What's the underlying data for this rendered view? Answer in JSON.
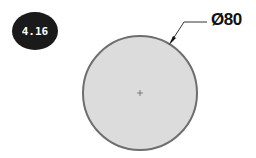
{
  "figure": {
    "badge_label": "4.16",
    "dimension_label": "Ø80",
    "circle": {
      "cx": 140,
      "cy": 93,
      "r": 57,
      "fill": "#dcdcdc",
      "stroke": "#6e6e6e"
    },
    "center_mark": "+",
    "leader": {
      "from": [
        171,
        42
      ],
      "elbow": [
        184,
        22
      ],
      "to": [
        207,
        22
      ]
    }
  }
}
